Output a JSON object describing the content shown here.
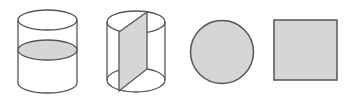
{
  "diagram": {
    "description": "Solids of revolution cross-sections: cylinder cut horizontally, cylinder cut vertically through axis, resulting circle and square",
    "colors": {
      "stroke": "#555555",
      "fill": "#d6d6d6",
      "background": "#ffffff"
    },
    "figures": [
      {
        "id": "cylinder-horizontal-section",
        "label": "Cylinder with horizontal cross-section (ellipse)"
      },
      {
        "id": "cylinder-vertical-section",
        "label": "Cylinder with vertical axial cross-section (rectangle)"
      },
      {
        "id": "circle",
        "label": "Circle"
      },
      {
        "id": "square",
        "label": "Square"
      }
    ]
  }
}
